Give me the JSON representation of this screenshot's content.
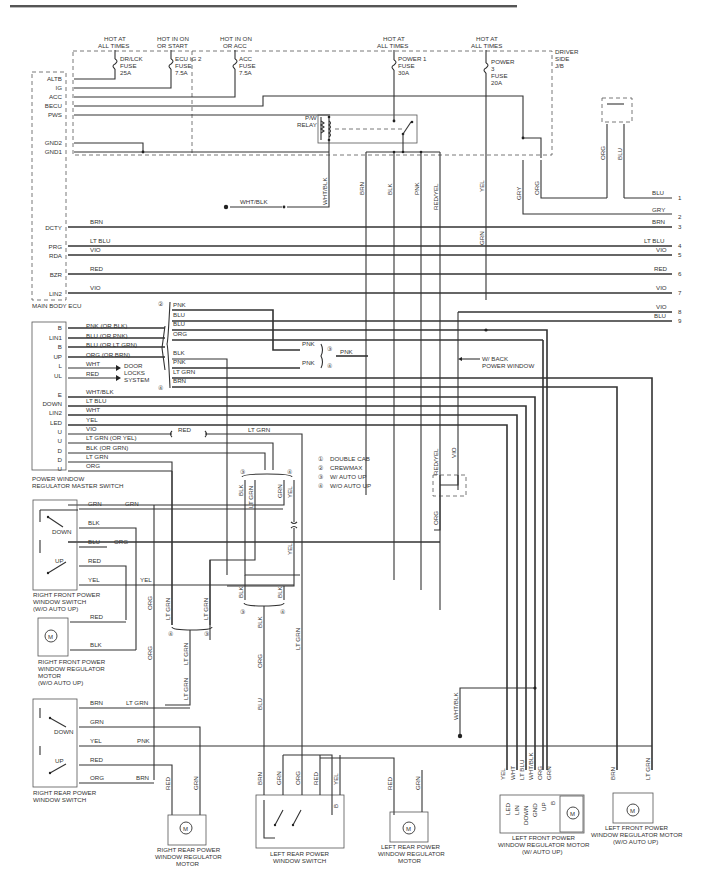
{
  "header": {
    "rule_color": "#555555"
  },
  "junction_block": {
    "name": "DRIVER SIDE J/B",
    "name_lines": [
      "DRIVER",
      "SIDE",
      "J/B"
    ],
    "fuses": [
      {
        "source": [
          "HOT AT",
          "ALL TIMES"
        ],
        "name": [
          "DR/LCK",
          "FUSE",
          "25A"
        ]
      },
      {
        "source": [
          "HOT IN ON",
          "OR START"
        ],
        "name": [
          "ECU IG 2",
          "FUSE",
          "7.5A"
        ]
      },
      {
        "source": [
          "HOT IN ON",
          "OR ACC"
        ],
        "name": [
          "ACC",
          "FUSE",
          "7.5A"
        ]
      },
      {
        "source": [
          "HOT AT",
          "ALL TIMES"
        ],
        "name": [
          "POWER 1",
          "FUSE",
          "30A"
        ]
      },
      {
        "source": [
          "HOT AT",
          "ALL TIMES"
        ],
        "name": [
          "POWER",
          "3",
          "FUSE",
          "20A"
        ]
      }
    ],
    "relay": [
      "P/W",
      "RELAY"
    ]
  },
  "main_body_ecu": {
    "name": "MAIN BODY ECU",
    "pins": [
      "ALTB",
      "IG",
      "ACC",
      "BECU",
      "PWS",
      "GND2",
      "GND1",
      "DCTY",
      "PRG",
      "RDA",
      "BZR",
      "LIN2"
    ],
    "wires": [
      "BRN",
      "LT BLU",
      "VIO",
      "RED",
      "VIO"
    ]
  },
  "ground_wire": "WHT/BLK",
  "jb_drops": [
    "WHT/BLK",
    "BRN",
    "BLK",
    "PNK",
    "RED/YEL",
    "YEL",
    "GRY",
    "ORG",
    "GRN"
  ],
  "right_connector": {
    "top_wires": [
      "ORG",
      "BLU"
    ],
    "pins": [
      {
        "num": "1",
        "wire": "BLU"
      },
      {
        "num": "2",
        "wire": "GRY"
      },
      {
        "num": "3",
        "wire": "BRN"
      },
      {
        "num": "4",
        "wire": "LT BLU"
      },
      {
        "num": "5",
        "wire": "VIO"
      },
      {
        "num": "6",
        "wire": "RED"
      },
      {
        "num": "7",
        "wire": "VIO"
      },
      {
        "num": "8",
        "wire": "VIO"
      },
      {
        "num": "9",
        "wire": "BLU"
      }
    ]
  },
  "master_switch": {
    "name": [
      "POWER WINDOW",
      "REGULATOR MASTER SWITCH"
    ],
    "pins": [
      {
        "pin": "B",
        "wire": "PNK  (OR BLK)"
      },
      {
        "pin": "LIN1",
        "wire": "BLU  (OR PNK)"
      },
      {
        "pin": "B",
        "wire": "BLU  (OR LT GRN)"
      },
      {
        "pin": "UP",
        "wire": "ORG  (OR BRN)"
      },
      {
        "pin": "L",
        "wire": "WHT"
      },
      {
        "pin": "UL",
        "wire": "RED"
      },
      {
        "pin": "E",
        "wire": "WHT/BLK"
      },
      {
        "pin": "DOWN",
        "wire": "LT BLU"
      },
      {
        "pin": "LIN2",
        "wire": "WHT"
      },
      {
        "pin": "LED",
        "wire": "YEL"
      },
      {
        "pin": "U",
        "wire": "VIO"
      },
      {
        "pin": "U",
        "wire": "LT GRN  (OR YEL)"
      },
      {
        "pin": "D",
        "wire": "BLK  (OR GRN)"
      },
      {
        "pin": "D",
        "wire": "LT GRN"
      },
      {
        "pin": "U",
        "wire": "ORG"
      }
    ],
    "door_locks": [
      "DOOR",
      "LOCKS",
      "SYSTEM"
    ]
  },
  "option_group": {
    "wires": [
      "PNK",
      "BLU",
      "BLU",
      "ORG",
      "BLK",
      "PNK",
      "LT GRN",
      "BRN"
    ],
    "mid_labels": [
      "PNK",
      "PNK",
      "PNK"
    ],
    "inline": [
      "RED",
      "LT GRN"
    ]
  },
  "back_window_note": [
    "W/ BACK",
    "POWER WINDOW"
  ],
  "legend": [
    {
      "num": "1",
      "text": "DOUBLE CAB"
    },
    {
      "num": "2",
      "text": "CREWMAX"
    },
    {
      "num": "3",
      "text": "W/ AUTO UP"
    },
    {
      "num": "4",
      "text": "W/O AUTO UP"
    }
  ],
  "rf_switch": {
    "name": [
      "RIGHT FRONT POWER",
      "WINDOW SWITCH",
      "(W/O AUTO UP)"
    ],
    "wires": [
      "GRN",
      "BLK",
      "BLU",
      "RED",
      "YEL"
    ],
    "far_wires": [
      "GRN",
      "ORG",
      "YEL"
    ],
    "labels": [
      "DOWN",
      "UP"
    ]
  },
  "rf_motor": {
    "name": [
      "RIGHT FRONT POWER",
      "WINDOW REGULATOR",
      "MOTOR",
      "(W/O AUTO UP)"
    ],
    "wires": [
      "RED",
      "BLK"
    ]
  },
  "rr_switch": {
    "name": [
      "RIGHT REAR POWER",
      "WINDOW SWITCH"
    ],
    "wires": [
      "BRN",
      "GRN",
      "YEL",
      "RED",
      "ORG"
    ],
    "far_wires": [
      "LT GRN",
      "PNK",
      "BRN"
    ],
    "labels": [
      "DOWN",
      "UP"
    ]
  },
  "rr_motor": {
    "name": [
      "RIGHT REAR POWER",
      "WINDOW REGULATOR",
      "MOTOR"
    ],
    "wires": [
      "RED",
      "GRN"
    ]
  },
  "lr_switch": {
    "name": [
      "LEFT REAR POWER",
      "WINDOW SWITCH"
    ],
    "wires": [
      "BRN",
      "GRN",
      "ORG",
      "RED",
      "YEL"
    ],
    "pin_b": "B"
  },
  "lr_motor": {
    "name": [
      "LEFT REAR POWER",
      "WINDOW REGULATOR",
      "MOTOR"
    ],
    "wires": [
      "RED",
      "GRN"
    ]
  },
  "lf_motor_auto": {
    "name": [
      "LEFT FRONT POWER",
      "WINDOW REGULATOR MOTOR",
      "(W/ AUTO UP)"
    ],
    "wires": [
      "YEL",
      "WHT",
      "LT BLU",
      "WHT/BLK",
      "ORG",
      "GRN"
    ],
    "pins": [
      "LED",
      "LIN",
      "DOWN",
      "GND",
      "UP",
      "B"
    ]
  },
  "lf_motor_noauto": {
    "name": [
      "LEFT FRONT POWER",
      "WINDOW REGULATOR MOTOR",
      "(W/O AUTO UP)"
    ],
    "wires": [
      "BRN",
      "LT GRN"
    ]
  },
  "mid_vertical_labels": [
    "BLK",
    "LT GRN",
    "GRN",
    "YEL",
    "YEL",
    "BLK",
    "BLK",
    "BLK",
    "ORG",
    "BLU",
    "LT GRN",
    "ORG",
    "ORG",
    "LT GRN",
    "LT GRN",
    "LT GRN",
    "LT GRN",
    "RED/YEL",
    "VIO",
    "ORG",
    "GRN",
    "WHT/BLK"
  ],
  "motor_symbol": "M"
}
